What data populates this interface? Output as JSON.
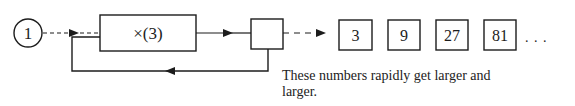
{
  "diagram": {
    "start_value": "1",
    "operation_label": "×(3)",
    "sequence": [
      "3",
      "9",
      "27",
      "81"
    ],
    "ellipsis": ". . .",
    "caption": "These numbers rapidly get larger and larger."
  },
  "colors": {
    "stroke": "#1c1c1c",
    "background": "#ffffff"
  }
}
